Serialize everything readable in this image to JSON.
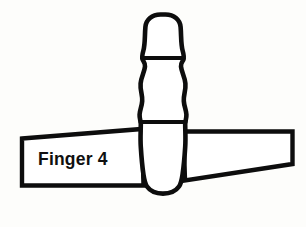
{
  "figure": {
    "kind": "anatomical-line-drawing",
    "background_color": "#fdfdfb",
    "stroke_color": "#0d0d0d",
    "fill_color": "#ffffff"
  },
  "label": {
    "text": "Finger 4",
    "color": "#101010",
    "x": 38,
    "y": 165
  },
  "bone": {
    "name": "finger-bone-outline",
    "segments": [
      {
        "name": "distal-phalanx",
        "label": ""
      },
      {
        "name": "middle-phalanx",
        "label": ""
      },
      {
        "name": "proximal-phalanx",
        "label": ""
      }
    ],
    "outline_path": "M 160.5 14.5 C 152.0 14.5 146.0 19.5 145.4 27.0 C 144.6 36.5 145.2 44.0 143.4 50.5 C 142.2 54.8 141.9 57.6 142.6 59.6 C 143.4 61.8 145.4 62.7 145.0 66.5 C 144.4 72.5 141.2 76.5 140.6 83.5 C 140.0 90.5 142.6 94.5 142.2 101.0 C 141.9 106.2 139.8 110.0 139.6 114.5 C 139.4 118.8 140.8 121.0 140.8 124.0 C 140.8 131.0 140.2 138.0 140.8 147.0 C 141.4 156.5 142.2 166.0 143.4 174.0 C 144.2 179.2 144.6 183.0 147.0 186.5 C 150.4 191.4 156.0 193.6 163.0 193.6 C 170.0 193.6 175.6 191.4 179.0 186.5 C 181.4 183.0 181.8 179.2 182.6 174.0 C 183.8 166.0 184.6 156.5 185.2 147.0 C 185.8 138.0 185.2 131.0 185.2 124.0 C 185.2 121.0 186.6 118.8 186.4 114.5 C 186.2 110.0 184.1 106.2 183.8 101.0 C 183.4 94.5 186.0 90.5 185.4 83.5 C 184.8 76.5 181.6 72.5 181.0 66.5 C 180.6 62.7 182.6 61.8 183.4 59.6 C 184.1 57.6 183.8 54.8 182.6 50.5 C 180.8 44.0 181.4 36.5 180.6 27.0 C 180.0 19.5 174.0 14.5 165.5 14.5 Z",
    "joint_lines": [
      {
        "name": "distal-middle-joint",
        "path": "M 143.8 58.0 L 182.2 58.0"
      },
      {
        "name": "middle-proximal-joint",
        "path": "M 140.4 122.0 L 185.6 122.0"
      }
    ]
  },
  "banner_left": {
    "name": "left-label-banner",
    "path": "M 22.0 138.5 L 142.0 129.0 L 143.5 185.5 L 22.0 185.5 Z"
  },
  "banner_right": {
    "name": "right-wing-banner",
    "path": "M 183.5 131.5 L 292.5 131.5 L 292.5 164.0 L 185.0 180.5 Z"
  }
}
